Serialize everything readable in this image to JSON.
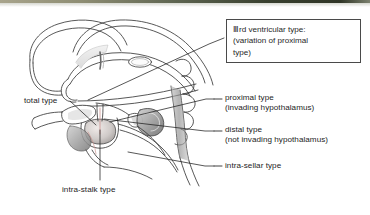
{
  "figure": {
    "kind": "anatomical-line-diagram",
    "background_color": "#ffffff",
    "line_color": "#3a3a3a",
    "shade_color": "#9a9a9a",
    "tint_color": "#c98a86",
    "top_band_color": "#39402f"
  },
  "callout": {
    "name": "third-ventricular-type-callout",
    "border_color": "#4a4a4a",
    "lines": [
      "Ⅲrd ventricular type:",
      "(variation of proximal",
      "type)"
    ],
    "line1": "Ⅲrd ventricular type:",
    "line2": "(variation of proximal",
    "line3": "type)"
  },
  "labels": {
    "total": {
      "title": "total type",
      "sub": ""
    },
    "proximal": {
      "title": "proximal type",
      "sub": "(invading hypothalamus)"
    },
    "distal": {
      "title": "distal type",
      "sub": "(not invading hypothalamus)"
    },
    "intrasellar": {
      "title": "intra-sellar type",
      "sub": ""
    },
    "intrastalk": {
      "title": "intra-stalk type",
      "sub": ""
    }
  },
  "leaders": {
    "names": [
      "callout-leader",
      "total-type-leader",
      "proximal-type-leader",
      "distal-type-leader",
      "intra-sellar-type-leader",
      "intra-stalk-type-leader"
    ]
  }
}
